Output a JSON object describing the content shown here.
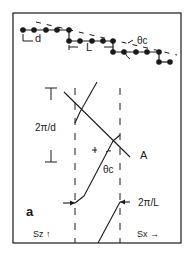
{
  "figure": {
    "panel_label": "a",
    "top": {
      "d_label": "d",
      "L_label": "L",
      "theta_label": "θc"
    },
    "bottom": {
      "period_d_label": "2π/d",
      "period_L_label": "2π/L",
      "line_label": "A",
      "theta_label": "θc",
      "axis_sz_label": "Sz ↑",
      "axis_sx_label": "Sx →"
    },
    "colors": {
      "ink": "#1a1a1a",
      "background": "#ffffff"
    }
  }
}
